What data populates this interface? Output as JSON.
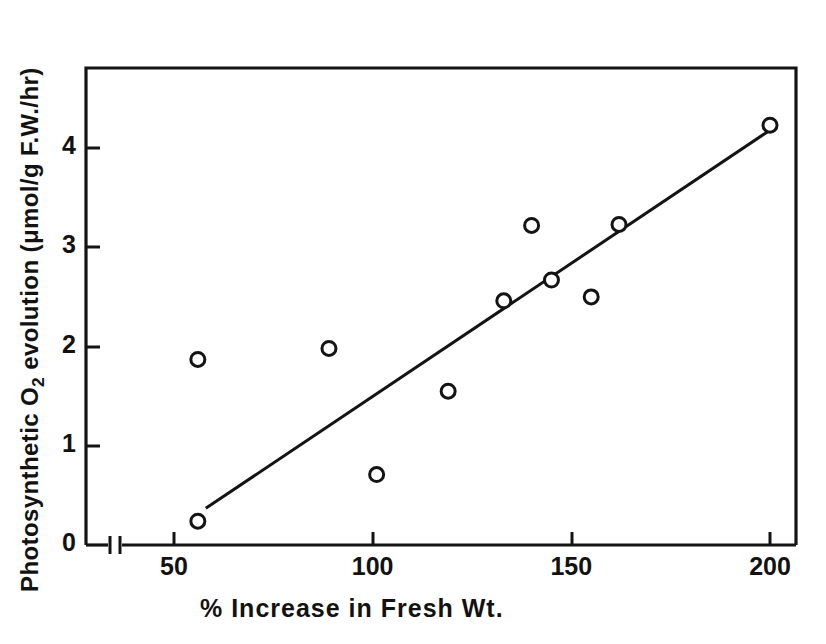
{
  "chart_data": {
    "type": "scatter",
    "title": "",
    "xlabel": "%  Increase  in  Fresh  Wt.",
    "ylabel_prefix": "Photosynthetic  O",
    "ylabel_sub": "2",
    "ylabel_suffix": " evolution (μmol/g F.W./hr)",
    "ylabel_full": "Photosynthetic O2 evolution (μmol/g F.W./hr)",
    "xlim": [
      36,
      215
    ],
    "ylim": [
      0,
      4.8
    ],
    "x_ticks": [
      50,
      100,
      150,
      200
    ],
    "x_tick_labels": [
      "50",
      "100",
      "150",
      "200"
    ],
    "y_ticks": [
      0,
      1,
      2,
      3,
      4
    ],
    "y_tick_labels": [
      "0",
      "1",
      "2",
      "3",
      "4"
    ],
    "axis_break": true,
    "axis_break_x": 40,
    "grid": false,
    "legend": false,
    "marker": "open-circle",
    "marker_color": "#141414",
    "line_color": "#141414",
    "points": [
      {
        "x": 56,
        "y": 0.24
      },
      {
        "x": 56,
        "y": 1.87
      },
      {
        "x": 89,
        "y": 1.98
      },
      {
        "x": 101,
        "y": 0.71
      },
      {
        "x": 119,
        "y": 1.55
      },
      {
        "x": 133,
        "y": 2.46
      },
      {
        "x": 140,
        "y": 3.22
      },
      {
        "x": 145,
        "y": 2.67
      },
      {
        "x": 155,
        "y": 2.5
      },
      {
        "x": 162,
        "y": 3.23
      },
      {
        "x": 200,
        "y": 4.23
      }
    ],
    "trend_line": {
      "label": "regression-line",
      "x_start": 58,
      "y_start": 0.37,
      "x_end": 200,
      "y_end": 4.18
    }
  }
}
